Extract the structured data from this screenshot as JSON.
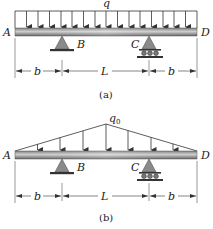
{
  "figures": [
    {
      "id": "a",
      "caption": "(a)",
      "load_type": "uniform",
      "load_label": "q",
      "arrow_count": 15,
      "points": {
        "A": "A",
        "B": "B",
        "C": "C",
        "D": "D"
      },
      "dimensions": [
        "b",
        "L",
        "b"
      ],
      "supports": {
        "B": "pin",
        "C": "roller"
      }
    },
    {
      "id": "b",
      "caption": "(b)",
      "load_type": "triangular",
      "load_label": "q",
      "load_subscript": "0",
      "arrow_count": 7,
      "points": {
        "A": "A",
        "B": "B",
        "C": "C",
        "D": "D"
      },
      "dimensions": [
        "b",
        "L",
        "b"
      ],
      "supports": {
        "B": "pin",
        "C": "roller"
      }
    }
  ],
  "colors": {
    "beam_dark": "#6e6e6e",
    "beam_light": "#d8d8d8",
    "support_fill": "#8a8a8a",
    "line": "#333333"
  }
}
